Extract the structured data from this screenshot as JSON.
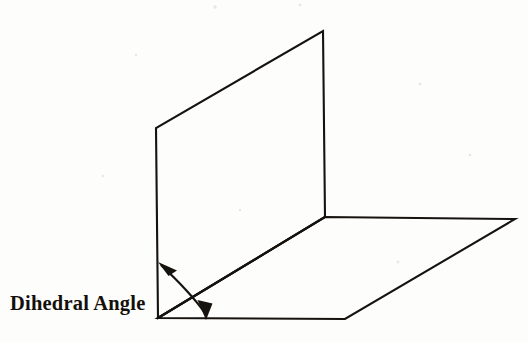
{
  "figure": {
    "title": "Dihedral Angle",
    "caption": "Dihedral Angle",
    "background_color": "#fdfdfc",
    "line_color": "#16130f",
    "canvas": {
      "width": 528,
      "height": 343
    },
    "planes": [
      {
        "name": "vertical-plane",
        "label": "Vertical plane",
        "points": "158,318 156,128 323,31 325,217"
      },
      {
        "name": "horizontal-plane",
        "label": "Horizontal plane",
        "points": "158,318 325,217 515,219 345,319"
      }
    ],
    "common_edge": {
      "name": "common-edge",
      "label": "Common edge of intersection",
      "from": "158,318",
      "to": "325,217"
    },
    "angle_marker": {
      "name": "dihedral-angle-arc",
      "label": "Dihedral Angle",
      "arc_path": "M 161,265 C 176,279 192,295 205,313",
      "arrow_start": {
        "x": 161,
        "y": 265,
        "points": "161,264 175,270 169,274"
      },
      "arrow_end": {
        "x": 205,
        "y": 316,
        "points": "205,318 198,301 212,303"
      }
    },
    "caption_position": {
      "x": 10,
      "y": 310
    }
  }
}
